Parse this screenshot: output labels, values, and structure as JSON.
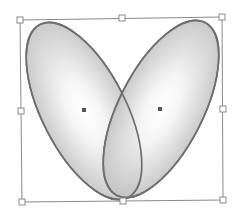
{
  "diagram": {
    "colors": {
      "stroke": "#6e6e6e",
      "fill_center": "#ffffff",
      "fill_edge": "#c4c4c4",
      "bbox": "#8a8a8a",
      "handle_fill": "#ffffff",
      "center_marker": "#555555"
    },
    "ellipses": [
      {
        "name": "left-ellipse",
        "cx": 84,
        "cy": 111,
        "rx": 42,
        "ry": 97,
        "rotate": -27
      },
      {
        "name": "right-ellipse",
        "cx": 161,
        "cy": 109,
        "rx": 42,
        "ry": 97,
        "rotate": 27
      }
    ],
    "bounding_box": {
      "corners": [
        [
          20,
          20
        ],
        [
          222,
          17
        ],
        [
          223,
          200
        ],
        [
          22,
          202
        ]
      ]
    },
    "handles": [
      {
        "name": "handle-top-left",
        "x": 20,
        "y": 20
      },
      {
        "name": "handle-top-middle",
        "x": 122,
        "y": 18
      },
      {
        "name": "handle-top-right",
        "x": 222,
        "y": 17
      },
      {
        "name": "handle-middle-left",
        "x": 21,
        "y": 111
      },
      {
        "name": "handle-middle-right",
        "x": 223,
        "y": 109
      },
      {
        "name": "handle-bottom-left",
        "x": 22,
        "y": 202
      },
      {
        "name": "handle-bottom-middle",
        "x": 123,
        "y": 201
      },
      {
        "name": "handle-bottom-right",
        "x": 223,
        "y": 200
      }
    ],
    "center_markers": [
      {
        "name": "left-center-marker",
        "x": 84,
        "y": 110
      },
      {
        "name": "right-center-marker",
        "x": 160,
        "y": 109
      }
    ]
  }
}
